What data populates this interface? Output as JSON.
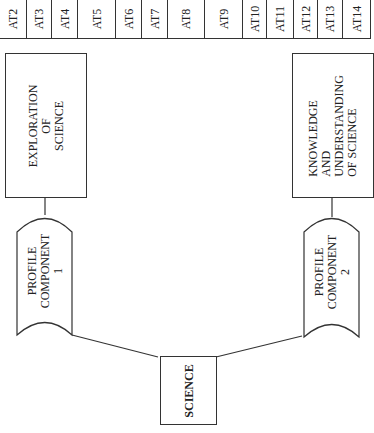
{
  "attainment_targets": [
    {
      "label": "AT2",
      "x": 0,
      "w": 27
    },
    {
      "label": "AT3",
      "x": 27,
      "w": 25
    },
    {
      "label": "AT4",
      "x": 52,
      "w": 26
    },
    {
      "label": "AT5",
      "x": 78,
      "w": 38
    },
    {
      "label": "AT6",
      "x": 116,
      "w": 26
    },
    {
      "label": "AT7",
      "x": 142,
      "w": 26
    },
    {
      "label": "AT8",
      "x": 168,
      "w": 37
    },
    {
      "label": "AT9",
      "x": 205,
      "w": 38
    },
    {
      "label": "AT10",
      "x": 243,
      "w": 24
    },
    {
      "label": "AT11",
      "x": 267,
      "w": 27
    },
    {
      "label": "AT12",
      "x": 294,
      "w": 24
    },
    {
      "label": "AT13",
      "x": 318,
      "w": 25
    },
    {
      "label": "AT14",
      "x": 343,
      "w": 28
    }
  ],
  "boxes": {
    "exploration": {
      "lines": [
        "EXPLORATION",
        "OF",
        "SCIENCE"
      ]
    },
    "knowledge": {
      "lines": [
        "KNOWLEDGE",
        "AND",
        "UNDERSTANDING",
        "OF SCIENCE"
      ]
    },
    "science": {
      "label": "SCIENCE"
    }
  },
  "profile_components": [
    {
      "lines": [
        "PROFILE",
        "COMPONENT",
        "1"
      ]
    },
    {
      "lines": [
        "PROFILE",
        "COMPONENT",
        "2"
      ]
    }
  ],
  "colors": {
    "stroke": "#333333",
    "background": "#ffffff"
  }
}
